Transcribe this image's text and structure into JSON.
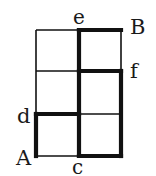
{
  "diagram": {
    "colors": {
      "line": "#111111",
      "background": "#ffffff"
    },
    "labels": {
      "A": "A",
      "B": "B",
      "c": "c",
      "d": "d",
      "e": "e",
      "f": "f"
    },
    "grid": {
      "columns": 2,
      "rows": 3
    }
  }
}
